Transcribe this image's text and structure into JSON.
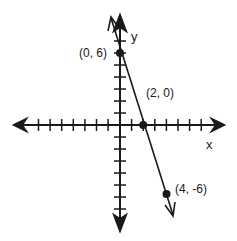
{
  "diagram": {
    "type": "coordinate-plane-line-graph",
    "axes": {
      "x_label": "x",
      "y_label": "y",
      "x_ticks_per_side": 7,
      "y_ticks_per_side": 8
    },
    "line": {
      "equation_points": [
        [
          0,
          6
        ],
        [
          2,
          0
        ],
        [
          4,
          -6
        ]
      ],
      "slope": -3,
      "y_intercept": 6
    },
    "points": [
      {
        "x": 0,
        "y": 6,
        "label": "(0, 6)"
      },
      {
        "x": 2,
        "y": 0,
        "label": "(2, 0)"
      },
      {
        "x": 4,
        "y": -6,
        "label": "(4, -6)"
      }
    ],
    "colors": {
      "ink": "#1a1a1a",
      "background": "#ffffff"
    }
  }
}
